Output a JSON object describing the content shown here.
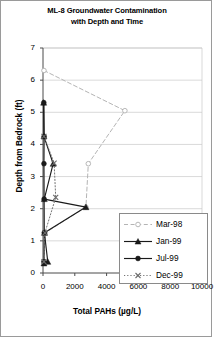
{
  "chart_data": {
    "type": "line",
    "title": "ML-8 Groundwater Contamination with Depth and Time",
    "title_line1": "ML-8 Groundwater Contamination",
    "title_line2": "with Depth and Time",
    "xlabel": "Total PAHs (µg/L)",
    "ylabel": "Depth from Bedrock (ft)",
    "xlim": [
      0,
      10000
    ],
    "ylim": [
      0,
      7
    ],
    "xticks": [
      "0",
      "2000",
      "4000",
      "6000",
      "8000",
      "10000"
    ],
    "xtick_values": [
      0,
      2000,
      4000,
      6000,
      8000,
      10000
    ],
    "yticks": [
      "0",
      "1",
      "2",
      "3",
      "4",
      "5",
      "6",
      "7"
    ],
    "ytick_values": [
      0,
      1,
      2,
      3,
      4,
      5,
      6,
      7
    ],
    "grid": "horizontal",
    "legend_position": "bottom-right",
    "orientation": "x = concentration, y = depth",
    "series": [
      {
        "name": "Mar-98",
        "marker": "open-circle",
        "line": "dashed",
        "color": "#b0b0b0",
        "points": [
          {
            "x": 60,
            "y": 6.3
          },
          {
            "x": 5150,
            "y": 5.05
          },
          {
            "x": 2850,
            "y": 3.4
          },
          {
            "x": 2700,
            "y": 2.05
          },
          {
            "x": 150,
            "y": 1.25
          },
          {
            "x": 60,
            "y": 0.35
          }
        ]
      },
      {
        "name": "Jan-99",
        "marker": "triangle",
        "line": "solid",
        "color": "#1a1a1a",
        "points": [
          {
            "x": 40,
            "y": 5.3
          },
          {
            "x": 60,
            "y": 4.25
          },
          {
            "x": 640,
            "y": 3.4
          },
          {
            "x": 80,
            "y": 2.3
          },
          {
            "x": 2700,
            "y": 2.05
          },
          {
            "x": 90,
            "y": 1.25
          },
          {
            "x": 300,
            "y": 0.35
          },
          {
            "x": 60,
            "y": 0.3
          }
        ]
      },
      {
        "name": "Jul-99",
        "marker": "filled-circle",
        "line": "solid",
        "color": "#1a1a1a",
        "points": [
          {
            "x": 50,
            "y": 5.3
          },
          {
            "x": 70,
            "y": 4.25
          },
          {
            "x": 60,
            "y": 3.4
          },
          {
            "x": 70,
            "y": 2.3
          },
          {
            "x": 80,
            "y": 1.25
          },
          {
            "x": 60,
            "y": 0.35
          }
        ]
      },
      {
        "name": "Dec-99",
        "marker": "x",
        "line": "dotted",
        "color": "#6a6a6a",
        "points": [
          {
            "x": 60,
            "y": 4.25
          },
          {
            "x": 700,
            "y": 3.42
          },
          {
            "x": 800,
            "y": 2.35
          },
          {
            "x": 120,
            "y": 1.25
          },
          {
            "x": 60,
            "y": 0.35
          }
        ]
      }
    ]
  },
  "legend": {
    "items": [
      {
        "label": "Mar-98"
      },
      {
        "label": "Jan-99"
      },
      {
        "label": "Jul-99"
      },
      {
        "label": "Dec-99"
      }
    ]
  }
}
